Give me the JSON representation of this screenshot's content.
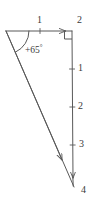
{
  "figure": {
    "type": "vector-triangle-diagram",
    "stroke_color": "#595959",
    "background_color": "#ffffff",
    "text_color": "#3a3a3a",
    "angle_label": "+65",
    "angle_degree_symbol": "°",
    "right_angle_marker": "right-angle-square",
    "horizontal_axis": {
      "ticks": [
        {
          "label": "1",
          "position": 1
        },
        {
          "label": "2",
          "position": 2
        }
      ]
    },
    "vertical_axis": {
      "ticks": [
        {
          "label": "1",
          "position": 1
        },
        {
          "label": "2",
          "position": 2
        },
        {
          "label": "3",
          "position": 3
        },
        {
          "label": "4",
          "position": 4
        }
      ]
    },
    "arrows": [
      {
        "name": "horizontal-vector",
        "direction": "right"
      },
      {
        "name": "vertical-vector",
        "direction": "down"
      },
      {
        "name": "hypotenuse-vector",
        "direction": "down-right"
      }
    ]
  }
}
